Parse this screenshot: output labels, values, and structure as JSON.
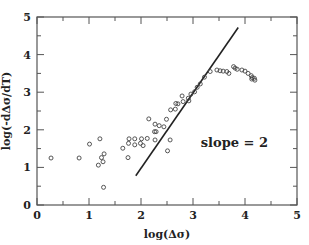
{
  "chart_data": {
    "type": "scatter",
    "title": "",
    "xlabel": "log(Δσ)",
    "ylabel": "log(-dΔσ/dT)",
    "xlim": [
      0,
      5
    ],
    "ylim": [
      0,
      5
    ],
    "x_ticks": [
      0,
      1,
      2,
      3,
      4,
      5
    ],
    "y_ticks": [
      0,
      1,
      2,
      3,
      4,
      5
    ],
    "x_tick_labels": [
      "0",
      "1",
      "2",
      "3",
      "4",
      "5"
    ],
    "y_tick_labels": [
      "0",
      "1",
      "2",
      "3",
      "4",
      "5"
    ],
    "minor_ticks": true,
    "grid": false,
    "series": [
      {
        "name": "data",
        "marker": "open-circle",
        "x": [
          0.27,
          0.81,
          1.01,
          1.21,
          1.29,
          1.24,
          1.27,
          1.18,
          1.28,
          1.65,
          1.75,
          1.76,
          1.77,
          1.88,
          1.88,
          1.99,
          2.01,
          2.04,
          2.12,
          2.15,
          2.26,
          2.27,
          2.27,
          2.29,
          2.35,
          2.44,
          2.49,
          2.51,
          2.56,
          2.57,
          2.66,
          2.67,
          2.71,
          2.79,
          2.81,
          2.91,
          2.92,
          2.96,
          3.03,
          3.08,
          3.14,
          3.22,
          3.33,
          3.46,
          3.52,
          3.58,
          3.65,
          3.69,
          3.78,
          3.81,
          3.85,
          3.94,
          4.0,
          4.06,
          4.12,
          4.13,
          4.14,
          4.18,
          4.19
        ],
        "y": [
          1.25,
          1.25,
          1.62,
          1.76,
          1.36,
          1.26,
          1.15,
          1.06,
          0.47,
          1.51,
          1.26,
          1.64,
          1.76,
          1.76,
          1.6,
          1.64,
          1.76,
          1.58,
          1.77,
          2.29,
          1.95,
          1.73,
          2.15,
          1.95,
          2.11,
          2.08,
          2.28,
          1.44,
          1.73,
          2.53,
          2.55,
          2.7,
          2.69,
          2.9,
          2.75,
          2.84,
          2.77,
          2.95,
          3.01,
          3.13,
          3.22,
          3.4,
          3.55,
          3.59,
          3.57,
          3.56,
          3.55,
          3.5,
          3.68,
          3.64,
          3.61,
          3.59,
          3.56,
          3.5,
          3.44,
          3.35,
          3.39,
          3.37,
          3.32
        ]
      }
    ],
    "fit_line": {
      "name": "slope = 2",
      "slope": 2,
      "x": [
        1.9,
        3.87
      ],
      "y": [
        0.78,
        4.72
      ]
    },
    "annotations": [
      {
        "text": "slope = 2",
        "x": 3.15,
        "y": 1.55
      }
    ]
  }
}
